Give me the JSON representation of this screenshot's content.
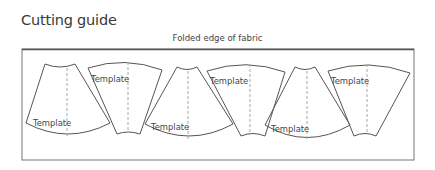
{
  "title": "Cutting guide",
  "fold_label": "Folded edge of fabric",
  "pieces": [
    {
      "label": "Template",
      "orientation": "narrow-top"
    },
    {
      "label": "Template",
      "orientation": "wide-top"
    },
    {
      "label": "Template",
      "orientation": "narrow-top"
    },
    {
      "label": "Template",
      "orientation": "wide-top"
    },
    {
      "label": "Template",
      "orientation": "narrow-top"
    },
    {
      "label": "Template",
      "orientation": "wide-top"
    }
  ],
  "colors": {
    "outline": "#555555",
    "dashed": "#aaaaaa",
    "text": "#3a3a3a"
  }
}
